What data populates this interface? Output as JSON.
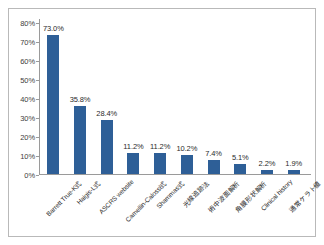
{
  "chart_data": {
    "type": "bar",
    "title": "",
    "subtitle": "",
    "xlabel": "",
    "ylabel": "",
    "ylim": [
      0,
      80
    ],
    "ytick_labels": [
      "80%",
      "70%",
      "60%",
      "50%",
      "40%",
      "30%",
      "20%",
      "10%",
      "0%"
    ],
    "ytick_values": [
      80,
      70,
      60,
      50,
      40,
      30,
      20,
      10,
      0
    ],
    "grid": false,
    "legend": false,
    "legend_position": "none",
    "bar_color": "#2e5f97",
    "categories": [
      "Barrett True-K式",
      "Haigis-L式",
      "ASCRS website",
      "Camellin-Calossi式",
      "Shammas式",
      "光線追跡法",
      "術中波面解析",
      "角膜形状解析",
      "Clinical history",
      "通常ケラト値"
    ],
    "values": [
      73.0,
      35.8,
      28.4,
      11.2,
      11.2,
      10.2,
      7.4,
      5.1,
      2.2,
      1.9
    ],
    "value_labels": [
      "73.0%",
      "35.8%",
      "28.4%",
      "11.2%",
      "11.2%",
      "10.2%",
      "7.4%",
      "5.1%",
      "2.2%",
      "1.9%"
    ]
  },
  "frame": {
    "border_color": "#b9b9b9",
    "background": "#ffffff"
  }
}
